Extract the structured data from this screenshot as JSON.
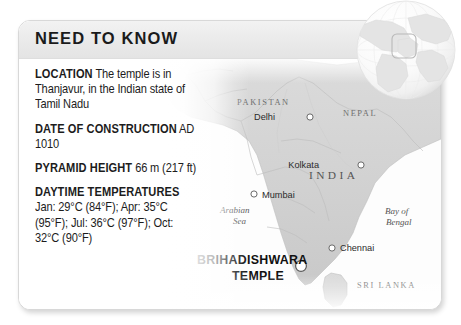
{
  "card": {
    "header_title": "NEED TO KNOW",
    "facts": [
      {
        "label": "LOCATION",
        "value": " The temple is in Thanjavur, in the Indian state of Tamil Nadu"
      },
      {
        "label": "DATE OF CONSTRUCTION",
        "value": " AD 1010"
      },
      {
        "label": "PYRAMID HEIGHT",
        "value": " 66 m (217 ft)"
      },
      {
        "label": "DAYTIME TEMPERATURES",
        "value": " Jan: 29°C (84°F); Apr: 35°C (95°F); Jul: 36°C (97°F); Oct: 32°C (90°F)"
      }
    ]
  },
  "map": {
    "countries": [
      {
        "name": "PAKISTAN",
        "x": 218,
        "y": 84
      },
      {
        "name": "NEPAL",
        "x": 324,
        "y": 95
      },
      {
        "name": "SRI LANKA",
        "x": 338,
        "y": 267
      }
    ],
    "india_label": "INDIA",
    "cities": [
      {
        "name": "Delhi",
        "x": 256,
        "y": 99,
        "dot_x": 291,
        "dot_y": 96
      },
      {
        "name": "Kolkata",
        "x": 300,
        "y": 141,
        "dot_x": 342,
        "dot_y": 144
      },
      {
        "name": "Mumbai",
        "x": 243,
        "y": 176,
        "dot_x": 235,
        "dot_y": 173
      },
      {
        "name": "Chennai",
        "x": 321,
        "y": 230,
        "dot_x": 313,
        "dot_y": 227
      }
    ],
    "seas": [
      {
        "name": "Arabian",
        "x": 201,
        "y": 192
      },
      {
        "name": "Sea",
        "x": 214,
        "y": 203
      },
      {
        "name": "Bay of",
        "x": 366,
        "y": 193
      },
      {
        "name": "Bengal",
        "x": 367,
        "y": 204
      }
    ],
    "site": {
      "line1": "BRIHADISHWARA",
      "line2": "TEMPLE",
      "marker_x": 282,
      "marker_y": 245
    }
  },
  "globe": {
    "name": "globe-inset",
    "locator_label": "India locator box"
  }
}
